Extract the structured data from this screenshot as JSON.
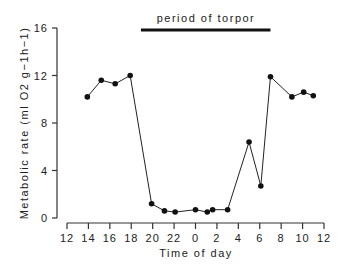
{
  "chart_data": {
    "type": "line",
    "title": "",
    "xlabel": "Time of day",
    "ylabel": "Metabolic rate (ml O2 g-1h-1)",
    "annotation": {
      "text": "period of torpor",
      "x_start_hour_offset": 6.9,
      "x_end_hour_offset": 19.0
    },
    "x_tick_labels": [
      "12",
      "14",
      "16",
      "18",
      "20",
      "22",
      "0",
      "2",
      "4",
      "6",
      "8",
      "10",
      "12"
    ],
    "y_tick_labels": [
      "0",
      "4",
      "8",
      "12",
      "16"
    ],
    "ylim": [
      0,
      16
    ],
    "xlim_hours_from_noon": [
      0,
      24
    ],
    "grid": false,
    "legend": null,
    "series": [
      {
        "name": "Metabolic rate",
        "x_time_of_day": [
          "14:00",
          "15:15",
          "16:30",
          "17:55",
          "19:55",
          "21:00",
          "22:00",
          "0:00",
          "1:00",
          "1:35",
          "3:00",
          "5:00",
          "6:05",
          "7:00",
          "9:00",
          "10:05",
          "11:00"
        ],
        "x_hours_from_noon": [
          1.9,
          3.2,
          4.5,
          5.9,
          7.9,
          9.1,
          10.1,
          12.0,
          13.1,
          13.6,
          15.0,
          17.0,
          18.1,
          19.0,
          21.0,
          22.1,
          23.0
        ],
        "values": [
          10.2,
          11.6,
          11.3,
          12.0,
          1.2,
          0.6,
          0.5,
          0.7,
          0.5,
          0.7,
          0.7,
          6.4,
          2.7,
          11.9,
          10.2,
          10.6,
          10.3
        ]
      }
    ]
  },
  "labels": {
    "annotation": "period of torpor",
    "xlabel": "Time of day",
    "ylabel": "Metabolic rate (ml O2 g−1h−1)"
  }
}
